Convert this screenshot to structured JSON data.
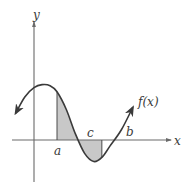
{
  "figure": {
    "labels": {
      "y_axis": "y",
      "x_axis": "x",
      "function": "f(x)",
      "point_a": "a",
      "point_c": "c",
      "point_b": "b"
    },
    "colors": {
      "curve": "#3a3a3a",
      "axes": "#6a6a6a",
      "shade": "#c8c8c8"
    }
  },
  "chart_data": {
    "type": "line",
    "title": "",
    "xlabel": "x",
    "ylabel": "y",
    "series": [
      {
        "name": "f(x)",
        "description": "Smooth wave-like curve, arrows at both ends; local max left of a, crosses x-axis at c, local min between c and b, rises back through x-axis after b",
        "x": [
          -0.8,
          -0.4,
          0,
          0.35,
          0.7,
          1.0,
          1.4,
          1.8,
          2.2,
          2.6,
          2.95,
          3.3,
          3.8,
          4.3
        ],
        "y": [
          1.3,
          2.1,
          2.55,
          2.7,
          2.65,
          2.35,
          1.5,
          0.3,
          -0.65,
          -1.05,
          -0.85,
          -0.3,
          0.5,
          1.6
        ]
      }
    ],
    "marked_points": [
      {
        "label": "a",
        "x": 1.0
      },
      {
        "label": "c",
        "x": 1.9
      },
      {
        "label": "b",
        "x": 2.95
      }
    ],
    "shaded_regions": [
      {
        "from": "a",
        "to": "c",
        "side": "above x-axis"
      },
      {
        "from": "c",
        "to": "b",
        "side": "below x-axis"
      }
    ],
    "ticks": "none",
    "grid": false,
    "legend": "none"
  }
}
